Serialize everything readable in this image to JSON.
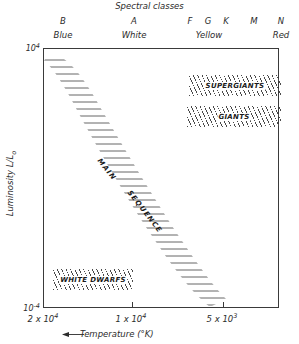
{
  "header": {
    "title": "Spectral classes"
  },
  "spectral_classes": [
    {
      "letter": "B",
      "x": 63
    },
    {
      "letter": "A",
      "x": 134
    },
    {
      "letter": "F",
      "x": 190
    },
    {
      "letter": "G",
      "x": 208
    },
    {
      "letter": "K",
      "x": 226
    },
    {
      "letter": "M",
      "x": 254
    },
    {
      "letter": "N",
      "x": 281
    }
  ],
  "spectral_colors": [
    {
      "label": "Blue",
      "x": 63
    },
    {
      "label": "White",
      "x": 134
    },
    {
      "label": "Yellow",
      "x": 209
    },
    {
      "label": "Red",
      "x": 281
    }
  ],
  "axes": {
    "y_title_text": "Luminosity  L/L",
    "y_title_sub": "o",
    "x_title": "Temperature (°K)",
    "y_ticks": [
      {
        "base": "10",
        "exp": "4",
        "y": 48
      },
      {
        "base": "10",
        "exp": "-4",
        "y": 308
      }
    ],
    "x_ticks": [
      {
        "mantissa": "2 x 10",
        "exp": "4",
        "x": 43
      },
      {
        "mantissa": "1 x 10",
        "exp": "4",
        "x": 131
      },
      {
        "mantissa": "5 x 10",
        "exp": "3",
        "x": 222
      }
    ]
  },
  "regions": [
    {
      "name": "SUPERGIANTS",
      "left": 145,
      "top": 26,
      "width": 92,
      "height": 21
    },
    {
      "name": "GIANTS",
      "left": 143,
      "top": 57,
      "width": 94,
      "height": 21
    },
    {
      "name": "WHITE DWARFS",
      "left": 9,
      "top": 220,
      "width": 80,
      "height": 21
    }
  ],
  "main_sequence": {
    "label_part1": "MAIN",
    "label_part2": "SEQUENCE"
  },
  "chart_data": {
    "type": "scatter",
    "subtitle": "Spectral classes",
    "xlabel": "Temperature (°K)",
    "ylabel": "Luminosity L/Lo",
    "xlim": [
      20000,
      4000
    ],
    "ylim": [
      0.0001,
      10000
    ],
    "x_scale": "log-reversed",
    "y_scale": "log",
    "grid": false,
    "legend": "none",
    "x_tick_labels": [
      "2 x 10^4",
      "1 x 10^4",
      "5 x 10^3"
    ],
    "x_tick_values": [
      20000,
      10000,
      5000
    ],
    "y_tick_labels": [
      "10^4",
      "10^-4"
    ],
    "y_tick_values": [
      10000,
      0.0001
    ],
    "top_axis_label": "Spectral classes",
    "spectral_class_ticks": [
      "B",
      "A",
      "F",
      "G",
      "K",
      "M",
      "N"
    ],
    "spectral_color_ticks": [
      "Blue",
      "White",
      "Yellow",
      "Red"
    ],
    "x_axis_direction": "decreasing left-to-right",
    "annotations": [
      "MAIN SEQUENCE",
      "SUPERGIANTS",
      "GIANTS",
      "WHITE DWARFS"
    ],
    "series": [
      {
        "name": "MAIN SEQUENCE",
        "shape": "diagonal band",
        "hatch": "horizontal lines",
        "points": [
          {
            "temperature": 19000,
            "luminosity": 6000
          },
          {
            "temperature": 14000,
            "luminosity": 300
          },
          {
            "temperature": 10000,
            "luminosity": 10
          },
          {
            "temperature": 7500,
            "luminosity": 0.8
          },
          {
            "temperature": 6000,
            "luminosity": 0.1
          },
          {
            "temperature": 4800,
            "luminosity": 0.01
          }
        ]
      },
      {
        "name": "SUPERGIANTS",
        "shape": "horizontal band",
        "hatch": "diagonal lines",
        "temperature_range": [
          9000,
          4000
        ],
        "luminosity_range": [
          2000,
          20000
        ]
      },
      {
        "name": "GIANTS",
        "shape": "horizontal band",
        "hatch": "diagonal lines",
        "temperature_range": [
          9000,
          4000
        ],
        "luminosity_range": [
          30,
          300
        ]
      },
      {
        "name": "WHITE DWARFS",
        "shape": "horizontal band",
        "hatch": "diagonal lines",
        "temperature_range": [
          18000,
          11000
        ],
        "luminosity_range": [
          0.0005,
          0.005
        ]
      }
    ]
  }
}
